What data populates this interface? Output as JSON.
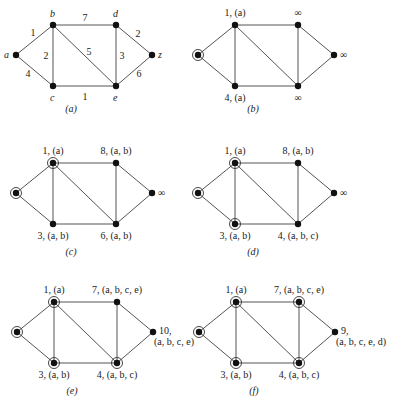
{
  "figure": {
    "vertices": [
      "a",
      "b",
      "c",
      "d",
      "e",
      "z"
    ],
    "edges": [
      {
        "from": "a",
        "to": "b",
        "weight": "1"
      },
      {
        "from": "a",
        "to": "c",
        "weight": "4"
      },
      {
        "from": "b",
        "to": "c",
        "weight": "2"
      },
      {
        "from": "b",
        "to": "d",
        "weight": "7"
      },
      {
        "from": "b",
        "to": "e",
        "weight": "5"
      },
      {
        "from": "c",
        "to": "e",
        "weight": "1"
      },
      {
        "from": "d",
        "to": "e",
        "weight": "3"
      },
      {
        "from": "d",
        "to": "z",
        "weight": "2"
      },
      {
        "from": "e",
        "to": "z",
        "weight": "6"
      }
    ],
    "panels": [
      {
        "caption": "(a)",
        "offset": [
          0,
          0
        ],
        "circled": [],
        "labels": {
          "a": "a",
          "b": "b",
          "c": "c",
          "d": "d",
          "e": "e",
          "z": "z"
        },
        "show_weights": true
      },
      {
        "caption": "(b)",
        "offset": [
          182,
          0
        ],
        "circled": [
          "a"
        ],
        "labels": {
          "a": "",
          "b": "1, (a)",
          "c": "4, (a)",
          "d": "∞",
          "e": "∞",
          "z": "∞"
        },
        "show_weights": false
      },
      {
        "caption": "(c)",
        "offset": [
          0,
          138
        ],
        "circled": [
          "a",
          "b"
        ],
        "labels": {
          "a": "",
          "b": "1, (a)",
          "c": "3, (a, b)",
          "d": "8, (a, b)",
          "e": "6, (a, b)",
          "z": "∞"
        },
        "show_weights": false
      },
      {
        "caption": "(d)",
        "offset": [
          182,
          138
        ],
        "circled": [
          "a",
          "b",
          "c"
        ],
        "labels": {
          "a": "",
          "b": "1, (a)",
          "c": "3, (a, b)",
          "d": "8, (a, b)",
          "e": "4, (a, b, c)",
          "z": "∞"
        },
        "show_weights": false
      },
      {
        "caption": "(e)",
        "offset": [
          1,
          277
        ],
        "circled": [
          "a",
          "b",
          "c",
          "e"
        ],
        "labels": {
          "a": "",
          "b": "1, (a)",
          "c": "3, (a, b)",
          "d": "7, (a, b, c, e)",
          "e": "4, (a, b, c)",
          "z": "10,",
          "z2": "(a, b, c, e)"
        },
        "show_weights": false
      },
      {
        "caption": "(f)",
        "offset": [
          183,
          277
        ],
        "circled": [
          "a",
          "b",
          "c",
          "d",
          "e"
        ],
        "labels": {
          "a": "",
          "b": "1, (a)",
          "c": "3, (a, b)",
          "d": "7, (a, b, c, e)",
          "e": "4, (a, b, c)",
          "z": "9,",
          "z2": "(a, b, c, e, d)"
        },
        "show_weights": false
      }
    ]
  }
}
